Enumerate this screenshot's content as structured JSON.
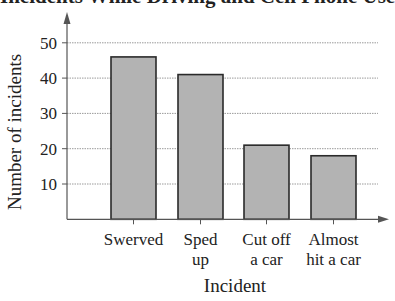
{
  "chart_data": {
    "type": "bar",
    "title": "Incidents While Driving and Cell Phone Use",
    "xlabel": "Incident",
    "ylabel": "Number of incidents",
    "categories": [
      [
        "Swerved"
      ],
      [
        "Sped",
        "up"
      ],
      [
        "Cut off",
        "a car"
      ],
      [
        "Almost",
        "hit a car"
      ]
    ],
    "category_labels": [
      "Swerved",
      "Sped up",
      "Cut off a car",
      "Almost hit a car"
    ],
    "values": [
      46,
      41,
      21,
      18
    ],
    "yticks": [
      10,
      20,
      30,
      40,
      50
    ],
    "ylim": [
      0,
      55
    ],
    "grid": true,
    "bar_color": "#b3b3b3",
    "bar_edge_color": "#2a2a2a",
    "grid_color": "#9a9a9a"
  }
}
